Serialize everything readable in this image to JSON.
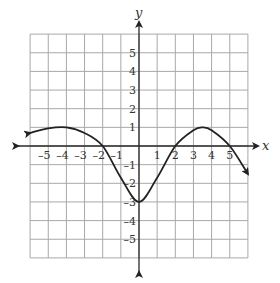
{
  "chart_data": {
    "type": "line",
    "title": "",
    "xlabel": "x",
    "ylabel": "y",
    "xlim": [
      -6,
      6
    ],
    "ylim": [
      -6,
      6
    ],
    "grid": true,
    "x_ticks": [
      -5,
      -4,
      -3,
      -2,
      -1,
      1,
      2,
      3,
      4,
      5
    ],
    "y_ticks": [
      5,
      4,
      3,
      2,
      1,
      -1,
      -2,
      -3,
      -4,
      -5
    ],
    "x_tick_labels": [
      "–5",
      "–4",
      "–3",
      "–2",
      "–1",
      "1",
      "2",
      "3",
      "4",
      "5"
    ],
    "y_tick_labels": [
      "5",
      "4",
      "3",
      "2",
      "1",
      "–1",
      "–2",
      "–3",
      "–4",
      "–5"
    ],
    "series": [
      {
        "name": "f(x)",
        "x": [
          -6,
          -5,
          -4,
          -3,
          -2,
          -1,
          0,
          1,
          2,
          3,
          3.5,
          4,
          5,
          6
        ],
        "y": [
          0.7,
          0.95,
          1.0,
          0.7,
          0.0,
          -1.7,
          -3.0,
          -1.7,
          0.0,
          0.85,
          1.0,
          0.85,
          0.0,
          -1.5
        ],
        "arrows": [
          "start",
          "end"
        ]
      }
    ],
    "annotations": {
      "x_intercepts": [
        -2,
        2,
        5
      ],
      "y_intercept": -3,
      "local_maxima": [
        [
          -4,
          1
        ],
        [
          3.5,
          1
        ]
      ],
      "local_minimum": [
        0,
        -3
      ]
    }
  },
  "axes": {
    "x_label": "x",
    "y_label": "y"
  },
  "colors": {
    "grid": "#a8a8a8",
    "axis": "#2a2a2a",
    "curve": "#222222",
    "background": "#ffffff"
  }
}
